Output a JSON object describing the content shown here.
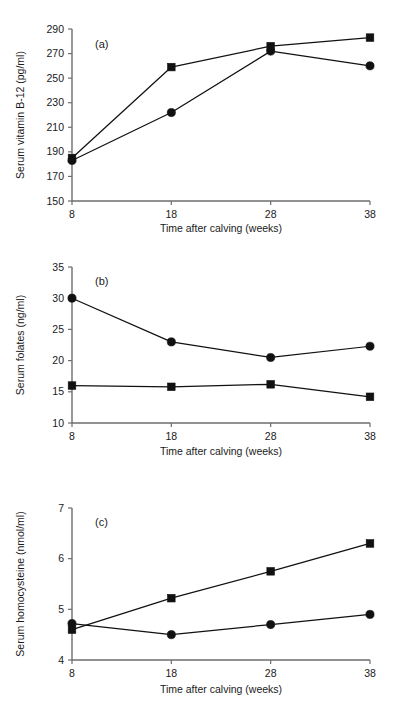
{
  "figure": {
    "panels": [
      {
        "tag": "(a)",
        "xlabel": "Time after calving (weeks)",
        "ylabel": "Serum vitamin B-12 (pg/ml)"
      },
      {
        "tag": "(b)",
        "xlabel": "Time after calving (weeks)",
        "ylabel": "Serum folates (ng/ml)"
      },
      {
        "tag": "(c)",
        "xlabel": "Time after calving (weeks)",
        "ylabel": "Serum homocysteine (nmol/ml)"
      }
    ]
  },
  "chart_data": [
    {
      "type": "line",
      "title": "(a)",
      "xlabel": "Time after calving (weeks)",
      "ylabel": "Serum vitamin B-12 (pg/ml)",
      "x": [
        8,
        18,
        28,
        38
      ],
      "xticklabels": [
        "8",
        "18",
        "28",
        "38"
      ],
      "xlim": [
        8,
        38
      ],
      "ylim": [
        150,
        290
      ],
      "yticks": [
        150,
        170,
        190,
        210,
        230,
        250,
        270,
        290
      ],
      "yticklabels": [
        "150",
        "170",
        "190",
        "210",
        "230",
        "250",
        "270",
        "290"
      ],
      "grid": false,
      "legend": "none",
      "series": [
        {
          "name": "circle-series",
          "marker": "circle",
          "values": [
            183,
            222,
            272,
            260
          ]
        },
        {
          "name": "square-series",
          "marker": "square",
          "values": [
            185,
            259,
            276,
            283
          ]
        }
      ]
    },
    {
      "type": "line",
      "title": "(b)",
      "xlabel": "Time after calving (weeks)",
      "ylabel": "Serum folates (ng/ml)",
      "x": [
        8,
        18,
        28,
        38
      ],
      "xticklabels": [
        "8",
        "18",
        "28",
        "38"
      ],
      "xlim": [
        8,
        38
      ],
      "ylim": [
        10,
        35
      ],
      "yticks": [
        10,
        15,
        20,
        25,
        30,
        35
      ],
      "yticklabels": [
        "10",
        "15",
        "20",
        "25",
        "30",
        "35"
      ],
      "grid": false,
      "legend": "none",
      "series": [
        {
          "name": "circle-series",
          "marker": "circle",
          "values": [
            30.0,
            23.0,
            20.5,
            22.3
          ]
        },
        {
          "name": "square-series",
          "marker": "square",
          "values": [
            16.0,
            15.8,
            16.2,
            14.2
          ]
        }
      ]
    },
    {
      "type": "line",
      "title": "(c)",
      "xlabel": "Time after calving (weeks)",
      "ylabel": "Serum homocysteine (nmol/ml)",
      "x": [
        8,
        18,
        28,
        38
      ],
      "xticklabels": [
        "8",
        "18",
        "28",
        "38"
      ],
      "xlim": [
        8,
        38
      ],
      "ylim": [
        4,
        7
      ],
      "yticks": [
        4,
        5,
        6,
        7
      ],
      "yticklabels": [
        "4",
        "5",
        "6",
        "7"
      ],
      "grid": false,
      "legend": "none",
      "series": [
        {
          "name": "circle-series",
          "marker": "circle",
          "values": [
            4.72,
            4.5,
            4.7,
            4.9
          ]
        },
        {
          "name": "square-series",
          "marker": "square",
          "values": [
            4.6,
            5.22,
            5.75,
            6.3
          ]
        }
      ]
    }
  ],
  "colors": {
    "marker": "#111111",
    "line": "#111111",
    "axis": "#6e6e6e",
    "text": "#1a1a1a",
    "background": "#ffffff"
  }
}
